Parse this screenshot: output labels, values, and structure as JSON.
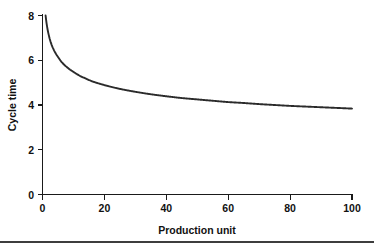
{
  "chart_data": {
    "type": "line",
    "title": "",
    "subtitle": "",
    "xlabel": "Production unit",
    "ylabel": "Cycle time",
    "xlim": [
      0,
      100
    ],
    "ylim": [
      0,
      8
    ],
    "xticks": [
      0,
      20,
      40,
      60,
      80,
      100
    ],
    "yticks": [
      0,
      2,
      4,
      6,
      8
    ],
    "xtick_labels": [
      "0",
      "20",
      "40",
      "60",
      "80",
      "100"
    ],
    "ytick_labels": [
      "0",
      "2",
      "4",
      "6",
      "8"
    ],
    "grid": false,
    "legend": false,
    "legend_position": "none",
    "series": [
      {
        "name": "Cycle time",
        "color": "#2b2b2b",
        "x": [
          1,
          2,
          3,
          4,
          5,
          6,
          7,
          8,
          9,
          10,
          12,
          14,
          16,
          18,
          20,
          25,
          30,
          35,
          40,
          45,
          50,
          55,
          60,
          65,
          70,
          75,
          80,
          85,
          90,
          95,
          100
        ],
        "values": [
          8.0,
          7.14,
          6.67,
          6.37,
          6.15,
          5.95,
          5.8,
          5.68,
          5.57,
          5.48,
          5.31,
          5.18,
          5.06,
          4.97,
          4.89,
          4.72,
          4.59,
          4.48,
          4.39,
          4.31,
          4.25,
          4.19,
          4.13,
          4.09,
          4.04,
          4.0,
          3.96,
          3.93,
          3.9,
          3.87,
          3.84
        ]
      }
    ],
    "annotations": []
  },
  "axes": {
    "x_title": "Production unit",
    "y_title": "Cycle time"
  },
  "colors": {
    "line": "#2b2b2b",
    "axis": "#1a1a1a",
    "text": "#111111",
    "rule": "#3d3d3d",
    "background": "#ffffff"
  }
}
